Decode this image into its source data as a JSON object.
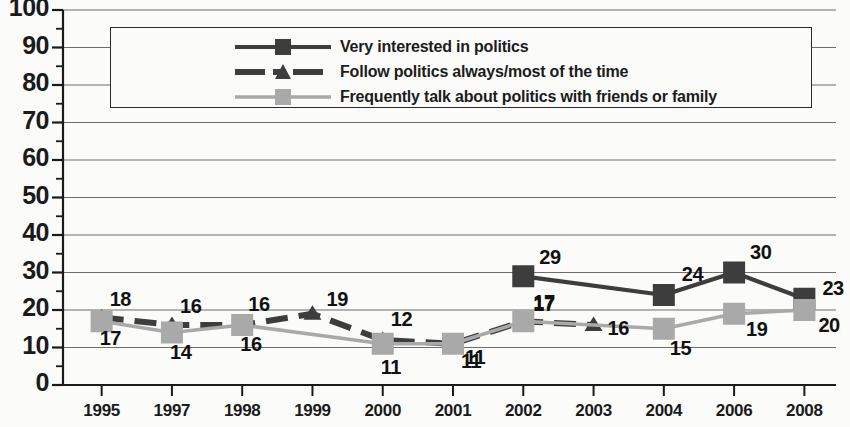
{
  "chart_data": {
    "type": "line",
    "title": "",
    "subtitle": "",
    "xlabel": "",
    "ylabel": "",
    "ylim": [
      0,
      100
    ],
    "ytick_step": 10,
    "yminor_step": 5,
    "grid": true,
    "legend_position": "top",
    "yticks": [
      "100",
      "90",
      "80",
      "70",
      "60",
      "50",
      "40",
      "30",
      "20",
      "10",
      "0"
    ],
    "categories": [
      "1995",
      "1997",
      "1998",
      "1999",
      "2000",
      "2001",
      "2002",
      "2003",
      "2004",
      "2006",
      "2008"
    ],
    "series": [
      {
        "name": "Very interested in politics",
        "color": "#3d3d3d",
        "marker": "square",
        "linestyle": "solid",
        "x": [
          "2002",
          "2004",
          "2006",
          "2008"
        ],
        "values": [
          29,
          24,
          30,
          23
        ],
        "labels": [
          "29",
          "24",
          "30",
          "23"
        ]
      },
      {
        "name": "Follow politics always/most of the time",
        "color": "#3d3d3d",
        "marker": "triangle",
        "linestyle": "dashed",
        "x": [
          "1995",
          "1997",
          "1998",
          "1999",
          "2000",
          "2001",
          "2002",
          "2003"
        ],
        "values": [
          18,
          16,
          16,
          19,
          12,
          11,
          17,
          16
        ],
        "labels": [
          "18",
          "16",
          "16",
          "19",
          "12",
          "11",
          "17",
          "16"
        ]
      },
      {
        "name": "Frequently talk about politics with friends or family",
        "color": "#a9a9a9",
        "marker": "square",
        "linestyle": "solid",
        "x": [
          "1995",
          "1997",
          "1998",
          "2000",
          "2001",
          "2002",
          "2004",
          "2006",
          "2008"
        ],
        "values": [
          17,
          14,
          16,
          11,
          11,
          17,
          15,
          19,
          20
        ],
        "labels": [
          "17",
          "14",
          "16",
          "11",
          "11",
          "17",
          "15",
          "19",
          "20"
        ]
      }
    ]
  },
  "legend": {
    "items": [
      {
        "label": "Very interested in politics",
        "swatch": "solid-dark-square"
      },
      {
        "label": "Follow politics always/most of the time",
        "swatch": "dashed-dark-triangle"
      },
      {
        "label": "Frequently talk about politics with friends or family",
        "swatch": "solid-gray-square"
      }
    ]
  },
  "colors": {
    "dark_series": "#3d3d3d",
    "gray_series": "#a9a9a9",
    "axis": "#1a1a1a",
    "grid": "#6d6d6d",
    "background": "#fbfbfa"
  },
  "annotations": [
    {
      "text": "18",
      "series": 1,
      "x": "1995"
    },
    {
      "text": "16",
      "series": 1,
      "x": "1997"
    },
    {
      "text": "16",
      "series": 1,
      "x": "1998"
    },
    {
      "text": "19",
      "series": 1,
      "x": "1999"
    },
    {
      "text": "12",
      "series": 1,
      "x": "2000"
    },
    {
      "text": "11",
      "series": 1,
      "x": "2001"
    },
    {
      "text": "17",
      "series": 1,
      "x": "2002"
    },
    {
      "text": "16",
      "series": 1,
      "x": "2003"
    },
    {
      "text": "17",
      "series": 2,
      "x": "1995"
    },
    {
      "text": "14",
      "series": 2,
      "x": "1997"
    },
    {
      "text": "16",
      "series": 2,
      "x": "1998"
    },
    {
      "text": "11",
      "series": 2,
      "x": "2000"
    },
    {
      "text": "11",
      "series": 2,
      "x": "2001"
    },
    {
      "text": "15",
      "series": 2,
      "x": "2004"
    },
    {
      "text": "19",
      "series": 2,
      "x": "2006"
    },
    {
      "text": "20",
      "series": 2,
      "x": "2008"
    },
    {
      "text": "29",
      "series": 0,
      "x": "2002"
    },
    {
      "text": "24",
      "series": 0,
      "x": "2004"
    },
    {
      "text": "30",
      "series": 0,
      "x": "2006"
    },
    {
      "text": "23",
      "series": 0,
      "x": "2008"
    }
  ]
}
